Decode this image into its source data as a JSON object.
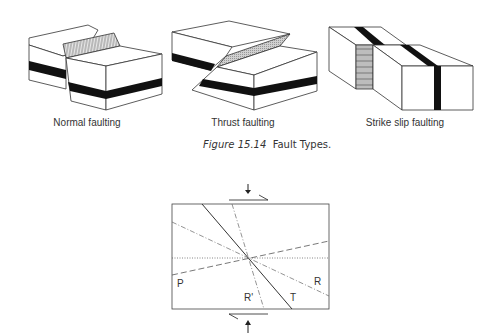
{
  "figure": {
    "caption_number": "Figure 15.14",
    "caption_text": "Fault Types."
  },
  "fault_blocks": [
    {
      "label": "Normal faulting"
    },
    {
      "label": "Thrust faulting"
    },
    {
      "label": "Strike slip  faulting"
    }
  ],
  "riedel_diagram": {
    "labels": {
      "P": "P",
      "R": "R",
      "R_prime": "R'",
      "T": "T"
    },
    "line_styles": {
      "T": "solid",
      "R": "dash-dot",
      "R_prime": "dash-dot",
      "P": "dashed",
      "reference": "dotted"
    },
    "arrows": {
      "top": "down",
      "bottom": "up",
      "shear_top": "right",
      "shear_bottom": "left"
    }
  }
}
